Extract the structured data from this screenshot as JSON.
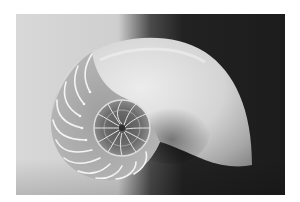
{
  "image": {
    "subject": "Nautilus shell cross-section",
    "style": "grayscale photograph",
    "colors": {
      "page_background": "#ffffff",
      "left_background": "#d6d6d6",
      "right_background": "#1e1e1e",
      "shell_outer": "#e4e4e4",
      "shell_shadow": "#7a7a7a",
      "chamber_walls": "#f2f2f2",
      "inner_spiral": "#3a3a3a"
    }
  }
}
